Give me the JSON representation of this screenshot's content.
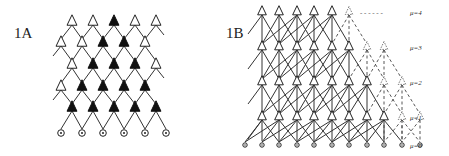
{
  "figure": {
    "panels": [
      {
        "id": "1A",
        "label": "1A",
        "description": "Layered lattice of triangular units above a row of circular input nodes; filled triangles form an inverted-triangle region",
        "layers": [
          {
            "row": 1,
            "y": 22,
            "x": [
              72,
              93,
              114,
              135,
              156
            ],
            "filled": [
              false,
              false,
              true,
              false,
              false
            ]
          },
          {
            "row": 2,
            "y": 43,
            "x": [
              61,
              82,
              103,
              124,
              145
            ],
            "filled": [
              false,
              false,
              true,
              true,
              false
            ]
          },
          {
            "row": 3,
            "y": 65,
            "x": [
              72,
              93,
              114,
              135,
              156
            ],
            "filled": [
              false,
              true,
              true,
              true,
              false
            ]
          },
          {
            "row": 4,
            "y": 87,
            "x": [
              61,
              82,
              103,
              124,
              145
            ],
            "filled": [
              false,
              true,
              true,
              true,
              true
            ]
          },
          {
            "row": 5,
            "y": 108,
            "x": [
              72,
              93,
              114,
              135,
              156
            ],
            "filled": [
              true,
              true,
              true,
              true,
              true
            ]
          }
        ],
        "inputs": {
          "y": 133,
          "x": [
            61,
            82,
            103,
            124,
            145,
            166
          ]
        }
      },
      {
        "id": "1B",
        "label": "1B",
        "description": "Stacked lattice with levels mu=0..4; solid units on left, dashed units fading to the right",
        "levels": [
          {
            "mu_label": "μ=4",
            "y": 12,
            "solid_x": [
              262,
              279,
              297,
              314,
              332
            ],
            "dashed_x": [
              349
            ],
            "trail": "- -  - -  - -"
          },
          {
            "mu_label": "μ=3",
            "y": 47,
            "solid_x": [
              262,
              279,
              297,
              314,
              332,
              349
            ],
            "dashed_x": [
              367,
              384
            ]
          },
          {
            "mu_label": "μ=2",
            "y": 82,
            "solid_x": [
              262,
              279,
              297,
              314,
              332,
              349,
              367
            ],
            "dashed_x": [
              384,
              402
            ]
          },
          {
            "mu_label": "μ=1",
            "y": 117,
            "solid_x": [
              262,
              279,
              297,
              314,
              332,
              349,
              367,
              384
            ],
            "dashed_x": [
              402,
              420
            ]
          },
          {
            "mu_label": "μ=0",
            "y": 145,
            "inputs_x": [
              245,
              262,
              279,
              297,
              314,
              332,
              349,
              367,
              384,
              402,
              420
            ]
          }
        ]
      }
    ]
  }
}
